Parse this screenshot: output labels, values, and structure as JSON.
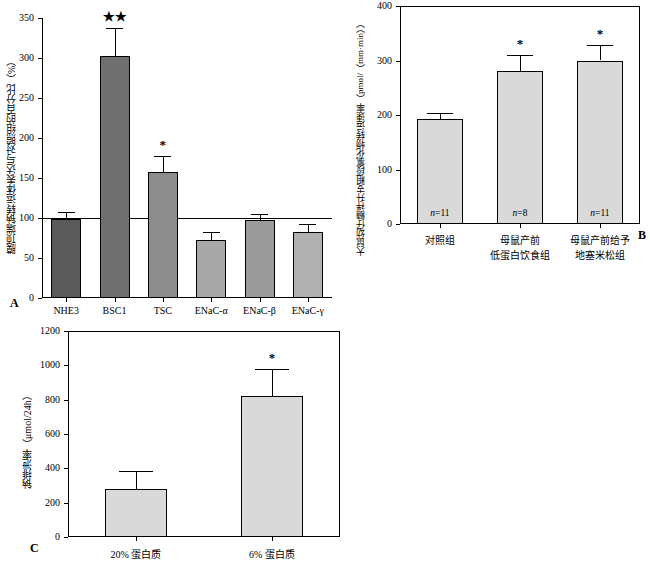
{
  "panelA": {
    "letter": "A",
    "ylabel": "膜顶端钠转运体表达与对照组的百分比（%）",
    "ylim": [
      0,
      350
    ],
    "yticks": [
      0,
      50,
      100,
      150,
      200,
      250,
      300,
      350
    ],
    "reference_line": 100,
    "categories": [
      "NHE3",
      "BSC1",
      "TSC",
      "ENaC-α",
      "ENaC-β",
      "ENaC-γ"
    ],
    "values": [
      99,
      302,
      157,
      72,
      98,
      83
    ],
    "errors": [
      9,
      35,
      20,
      10,
      7,
      10
    ],
    "significance": [
      "",
      "★★",
      "*",
      "",
      "",
      ""
    ],
    "bar_colors": [
      "#5a5a5a",
      "#6f6f6f",
      "#8d8d8d",
      "#a8a8a8",
      "#9a9a9a",
      "#b0b0b0"
    ]
  },
  "panelB": {
    "letter": "B",
    "ylabel": "大鼠幼仔髓袢升支粗段氯化物转运速率（pmol/（mm·min））",
    "ylim": [
      0,
      400
    ],
    "yticks": [
      0,
      100,
      200,
      300,
      400
    ],
    "categories": [
      "对照组",
      "母鼠产前\n低蛋白饮食组",
      "母鼠产前给予\n地塞米松组"
    ],
    "values": [
      192,
      281,
      300
    ],
    "errors": [
      12,
      30,
      28
    ],
    "significance": [
      "",
      "*",
      "*"
    ],
    "n_labels": [
      "n=11",
      "n=8",
      "n=11"
    ],
    "bar_color": "#d9d9d9"
  },
  "panelC": {
    "letter": "C",
    "ylabel": "钠排泄率（μmol/24h）",
    "ylim": [
      0,
      1200
    ],
    "yticks": [
      0,
      200,
      400,
      600,
      800,
      1000,
      1200
    ],
    "categories": [
      "20%  蛋白质",
      "6%  蛋白质"
    ],
    "values": [
      278,
      822
    ],
    "errors": [
      105,
      158
    ],
    "significance": [
      "",
      "*"
    ],
    "bar_color": "#d9d9d9"
  },
  "chart_data": [
    {
      "type": "bar",
      "panel": "A",
      "title": "",
      "xlabel": "",
      "ylabel": "膜顶端钠转运体表达与对照组的百分比（%）",
      "categories": [
        "NHE3",
        "BSC1",
        "TSC",
        "ENaC-α",
        "ENaC-β",
        "ENaC-γ"
      ],
      "values": [
        99,
        302,
        157,
        72,
        98,
        83
      ],
      "errors": [
        9,
        35,
        20,
        10,
        7,
        10
      ],
      "annotations": [
        "",
        "★★",
        "*",
        "",
        "",
        ""
      ],
      "ylim": [
        0,
        350
      ],
      "yticks": [
        0,
        50,
        100,
        150,
        200,
        250,
        300,
        350
      ],
      "grid": false,
      "legend": "none"
    },
    {
      "type": "bar",
      "panel": "B",
      "title": "",
      "xlabel": "",
      "ylabel": "大鼠幼仔髓袢升支粗段氯化物转运速率（pmol/（mm·min））",
      "categories": [
        "对照组",
        "母鼠产前低蛋白饮食组",
        "母鼠产前给予地塞米松组"
      ],
      "values": [
        192,
        281,
        300
      ],
      "errors": [
        12,
        30,
        28
      ],
      "annotations": [
        "n=11",
        "n=8 *",
        "n=11 *"
      ],
      "ylim": [
        0,
        400
      ],
      "yticks": [
        0,
        100,
        200,
        300,
        400
      ],
      "grid": false,
      "legend": "none"
    },
    {
      "type": "bar",
      "panel": "C",
      "title": "",
      "xlabel": "",
      "ylabel": "钠排泄率（μmol/24h）",
      "categories": [
        "20% 蛋白质",
        "6% 蛋白质"
      ],
      "values": [
        278,
        822
      ],
      "errors": [
        105,
        158
      ],
      "annotations": [
        "",
        "*"
      ],
      "ylim": [
        0,
        1200
      ],
      "yticks": [
        0,
        200,
        400,
        600,
        800,
        1000,
        1200
      ],
      "grid": false,
      "legend": "none"
    }
  ]
}
